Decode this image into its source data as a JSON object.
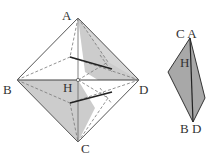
{
  "figure_left": {
    "labels": {
      "A": "A",
      "B": "B",
      "C": "C",
      "D": "D",
      "H": "H"
    },
    "fill_color": "#c8c8c8",
    "line_color": "#555555"
  },
  "figure_right": {
    "labels": {
      "top": "C A",
      "H": "H",
      "bottom": "B D"
    },
    "fill_color": "#a8a8a8"
  }
}
